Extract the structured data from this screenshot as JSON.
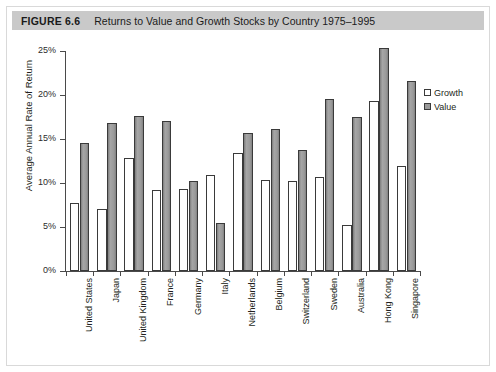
{
  "figure": {
    "label": "FIGURE 6.6",
    "title": "Returns to Value and Growth Stocks by Country 1975–1995"
  },
  "legend": {
    "position": "right",
    "items": [
      {
        "name": "Growth",
        "swatch": "hollow-square-white"
      },
      {
        "name": "Value",
        "swatch": "filled-square-gray"
      }
    ]
  },
  "colors": {
    "caption_bar": "#c9c9c9",
    "growth_bar": "#ffffff",
    "value_bar": "#9a9a9a",
    "bar_outline": "#3a3a3a",
    "axis": "#4a4a4a",
    "text": "#231f20",
    "frame": "#d9d9d9"
  },
  "chart_data": {
    "type": "bar",
    "title": "Returns to Value and Growth Stocks by Country 1975–1995",
    "xlabel": "",
    "ylabel": "Average Annual Rate of Return",
    "ylim": [
      0,
      25
    ],
    "ytick_values": [
      0,
      5,
      10,
      15,
      20,
      25
    ],
    "ytick_labels": [
      "0%",
      "5%",
      "10%",
      "15%",
      "20%",
      "25%"
    ],
    "grid": false,
    "legend_position": "right",
    "units": "percent",
    "categories": [
      "United States",
      "Japan",
      "United Kingdom",
      "France",
      "Germany",
      "Italy",
      "Netherlands",
      "Belgium",
      "Switzerland",
      "Sweden",
      "Australia",
      "Hong Kong",
      "Singapore"
    ],
    "series": [
      {
        "name": "Growth",
        "values": [
          7.7,
          7.0,
          12.8,
          9.2,
          9.3,
          10.9,
          13.4,
          10.3,
          10.2,
          10.7,
          5.2,
          19.3,
          11.9
        ]
      },
      {
        "name": "Value",
        "values": [
          14.5,
          16.8,
          17.6,
          17.0,
          10.2,
          5.4,
          15.7,
          16.1,
          13.7,
          19.6,
          17.5,
          25.3,
          21.6
        ]
      }
    ]
  }
}
